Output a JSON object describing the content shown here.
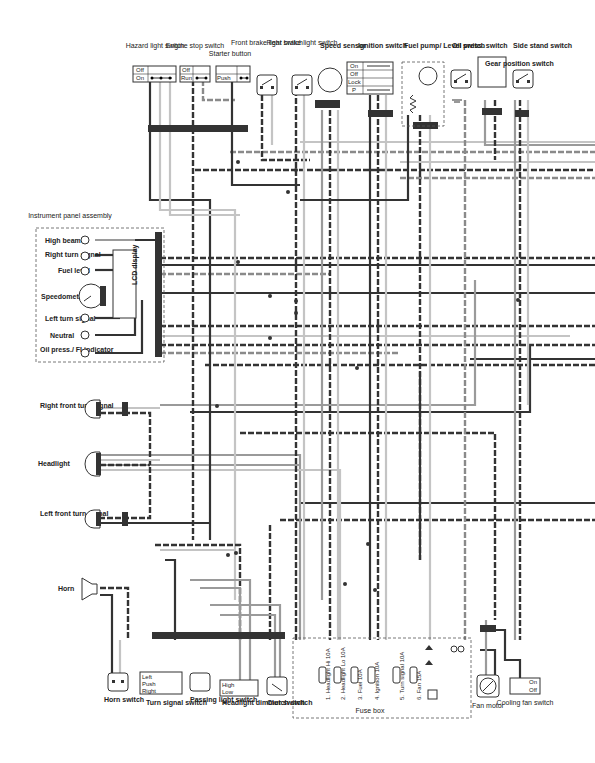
{
  "top_components": [
    {
      "id": "hazard",
      "label": "Hazard light switch",
      "positions": [
        "Off",
        "On"
      ]
    },
    {
      "id": "engine_stop",
      "label": "Engine stop switch",
      "positions": [
        "Off",
        "Run"
      ]
    },
    {
      "id": "starter",
      "label": "Starter button",
      "positions": [
        "Push"
      ]
    },
    {
      "id": "front_brake",
      "label": "Front brake light switch"
    },
    {
      "id": "rear_brake",
      "label": "Rear brake light switch"
    },
    {
      "id": "speed_sensor",
      "label": "Speed sensor"
    },
    {
      "id": "ignition",
      "label": "Ignition switch",
      "positions": [
        "On",
        "Off",
        "Lock",
        "P"
      ]
    },
    {
      "id": "fuel_pump",
      "label": "Fuel pump/ Level switch"
    },
    {
      "id": "oil_press",
      "label": "Oil press. switch"
    },
    {
      "id": "gear_position",
      "label": "Gear position switch"
    },
    {
      "id": "side_stand",
      "label": "Side stand switch"
    }
  ],
  "instrument_panel": {
    "title": "Instrument panel assembly",
    "display": "LCD display",
    "items": [
      "High beam",
      "Right turn signal",
      "Fuel level",
      "Speedometer",
      "Left turn signal",
      "Neutral",
      "Oil press./ FI indicator"
    ]
  },
  "left_components": [
    {
      "id": "right_front_turn",
      "label": "Right front turn signal"
    },
    {
      "id": "headlight",
      "label": "Headlight"
    },
    {
      "id": "left_front_turn",
      "label": "Left front turn signal"
    },
    {
      "id": "horn",
      "label": "Horn"
    }
  ],
  "bottom_components": [
    {
      "id": "horn_switch",
      "label": "Horn switch"
    },
    {
      "id": "turn_signal_switch",
      "label": "Turn signal switch",
      "positions": [
        "Left",
        "Push",
        "Right"
      ]
    },
    {
      "id": "passing_light_switch",
      "label": "Passing light switch"
    },
    {
      "id": "headlight_dimmer",
      "label": "Headlight dimmer switch",
      "positions": [
        "High",
        "Low"
      ]
    },
    {
      "id": "clutch_switch",
      "label": "Clutch switch"
    },
    {
      "id": "fan_motor",
      "label": "Fan motor"
    },
    {
      "id": "cooling_fan_switch",
      "label": "Cooling fan switch",
      "positions": [
        "On",
        "Off"
      ]
    }
  ],
  "fuse_box": {
    "label": "Fuse box",
    "fuses": [
      "1. Headlight Hi 10A",
      "2. Headlight Lo 10A",
      "3. Fuel 10A",
      "4. Ignition 10A",
      "5. Turn signal 10A",
      "6. Fan 15A"
    ]
  }
}
